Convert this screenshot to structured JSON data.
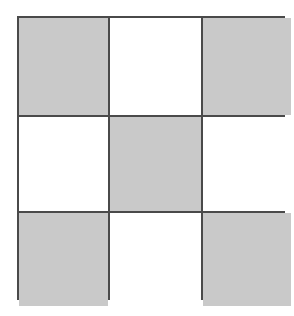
{
  "figure": {
    "rows": 3,
    "columns": 3,
    "colors": {
      "shaded_cell": "#c9c9c9",
      "blank_cell": "#ffffff",
      "grid_line": "#4a4a4a",
      "page_background": "#ffffff"
    },
    "grid": {
      "outer_border_width_px": 2,
      "inner_line_width_px": 2,
      "left_px": 17,
      "top_px": 16,
      "width_px": 268,
      "height_px": 284,
      "column_widths_px": [
        89,
        91,
        88
      ],
      "row_heights_px": [
        97,
        94,
        93
      ],
      "vertical_line_x_px": [
        106,
        197
      ],
      "horizontal_line_y_px": [
        113,
        207
      ]
    },
    "cells": [
      {
        "row": 1,
        "column": 1,
        "state": "shaded",
        "label": ""
      },
      {
        "row": 1,
        "column": 2,
        "state": "blank",
        "label": ""
      },
      {
        "row": 1,
        "column": 3,
        "state": "shaded",
        "label": ""
      },
      {
        "row": 2,
        "column": 1,
        "state": "blank",
        "label": ""
      },
      {
        "row": 2,
        "column": 2,
        "state": "shaded",
        "label": ""
      },
      {
        "row": 2,
        "column": 3,
        "state": "blank",
        "label": ""
      },
      {
        "row": 3,
        "column": 1,
        "state": "shaded",
        "label": ""
      },
      {
        "row": 3,
        "column": 2,
        "state": "blank",
        "label": ""
      },
      {
        "row": 3,
        "column": 3,
        "state": "shaded",
        "label": ""
      }
    ]
  },
  "scan_artifacts": [
    {
      "text": "—",
      "left_px": 112,
      "top_px": 60
    },
    {
      "text": "—",
      "left_px": 110,
      "top_px": 82
    },
    {
      "text": "—",
      "left_px": 30,
      "top_px": 128
    },
    {
      "text": "—",
      "left_px": 28,
      "top_px": 178
    },
    {
      "text": "—",
      "left_px": 208,
      "top_px": 128
    },
    {
      "text": "—",
      "left_px": 206,
      "top_px": 180
    },
    {
      "text": "—",
      "left_px": 30,
      "top_px": 238
    }
  ]
}
